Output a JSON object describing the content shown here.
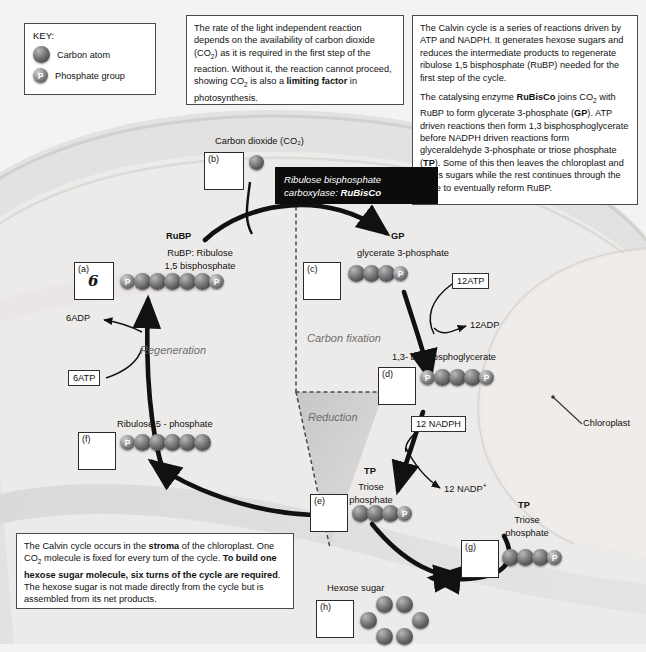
{
  "key": {
    "title": "KEY:",
    "items": [
      {
        "glyph": "",
        "label": "Carbon atom"
      },
      {
        "glyph": "P",
        "label": "Phosphate group"
      }
    ]
  },
  "notes": {
    "top_middle": {
      "paragraphs": [
        "The rate of the light independent reaction depends on the availability of carbon dioxide (CO₂) as it is required in the first step of the reaction. Without it, the reaction cannot proceed, showing CO₂ is also a limiting factor in photosynthesis."
      ],
      "bold_phrases": [
        "limiting factor"
      ]
    },
    "top_right": {
      "paragraphs": [
        "The Calvin cycle is a series of reactions driven by ATP and NADPH. It generates hexose sugars and reduces the intermediate products to regenerate ribulose 1,5 bisphosphate (RuBP) needed for the first step of the cycle.",
        "The catalysing enzyme RuBisCo joins CO₂ with RuBP to form glycerate 3-phosphate (GP). ATP driven reactions then form 1,3 bisphosphoglycerate before NADPH driven reactions form glyceraldehyde 3-phosphate or triose phosphate (TP). Some of this then leaves the chloroplast and forms sugars while the rest continues through the cycle to eventually reform RuBP."
      ],
      "bold_phrases": [
        "RuBisCo",
        "GP",
        "TP"
      ]
    },
    "bottom_left": {
      "paragraphs": [
        "The Calvin cycle occurs in the stroma of the chloroplast. One CO₂ molecule is fixed for every turn of the cycle. To build one hexose sugar molecule, six turns of the cycle are required. The hexose sugar is not made directly from the cycle but is assembled from its net products."
      ],
      "bold_phrases": [
        "stroma",
        "To build one hexose sugar molecule, six turns of the cycle are required"
      ]
    }
  },
  "enzyme_label": {
    "line1": "Ribulose bisphosphate",
    "line2_prefix": "carboxylase: ",
    "line2_bold": "RuBisCo"
  },
  "labels": {
    "carbon_dioxide": "Carbon dioxide (CO₂)",
    "rubp_title": "RuBP",
    "rubp_sub1": "RuBP: Ribulose",
    "rubp_sub2": "1,5 bisphosphate",
    "gp_title": "GP",
    "gp_sub": "glycerate 3-phosphate",
    "bpg_title": "1,3- bisphosphoglycerate",
    "tp_title": "TP",
    "tp_sub1": "Triose",
    "tp_sub2": "phosphate",
    "tp2_title": "TP",
    "tp2_sub1": "Triose",
    "tp2_sub2": "phosphate",
    "ru5p": "Ribulose 5 - phosphate",
    "hexose": "Hexose sugar",
    "chloroplast": "Chloroplast"
  },
  "sectors": {
    "carbon_fixation": "Carbon fixation",
    "reduction": "Reduction",
    "regeneration": "Regeneration"
  },
  "cofactors": {
    "atp12": "12ATP",
    "adp12": "12ADP",
    "nadph12": "12 NADPH",
    "nadp12": "12 NADP⁺",
    "atp6": "6ATP",
    "adp6": "6ADP"
  },
  "answer_boxes": [
    {
      "tag": "(a)",
      "answer": "6"
    },
    {
      "tag": "(b)",
      "answer": ""
    },
    {
      "tag": "(c)",
      "answer": ""
    },
    {
      "tag": "(d)",
      "answer": ""
    },
    {
      "tag": "(e)",
      "answer": ""
    },
    {
      "tag": "(f)",
      "answer": ""
    },
    {
      "tag": "(g)",
      "answer": ""
    },
    {
      "tag": "(h)",
      "answer": ""
    }
  ],
  "molecules": {
    "rubp": [
      "P",
      "C",
      "C",
      "C",
      "C",
      "C",
      "P"
    ],
    "gp": [
      "C",
      "C",
      "C",
      "P"
    ],
    "bpg": [
      "P",
      "C",
      "C",
      "C",
      "P"
    ],
    "tp": [
      "C",
      "C",
      "C",
      "P"
    ],
    "tp2": [
      "C",
      "C",
      "C",
      "P"
    ],
    "ru5p": [
      "P",
      "C",
      "C",
      "C",
      "C",
      "C"
    ],
    "hexose_ring_count": 6
  },
  "colors": {
    "chloroplast_fill": "#e2e1df",
    "stroma_fill": "#eceae8",
    "enzyme_bg": "#0c0c0c",
    "sector_text": "#6d6d6d",
    "page_bg": "#f4f3f1"
  }
}
